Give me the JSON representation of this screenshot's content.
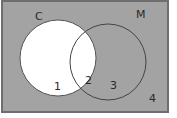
{
  "diagram": {
    "type": "venn",
    "background_color": "#a3a3a3",
    "border_color": "#6e6e6e",
    "sets": [
      {
        "name": "C",
        "label": "C",
        "fill": "#ffffff"
      },
      {
        "name": "M",
        "label": "M",
        "fill": "none"
      }
    ],
    "regions": [
      {
        "id": "1",
        "label": "1",
        "description": "C only"
      },
      {
        "id": "2",
        "label": "2",
        "description": "C and M"
      },
      {
        "id": "3",
        "label": "3",
        "description": "M only"
      },
      {
        "id": "4",
        "label": "4",
        "description": "neither"
      }
    ]
  }
}
